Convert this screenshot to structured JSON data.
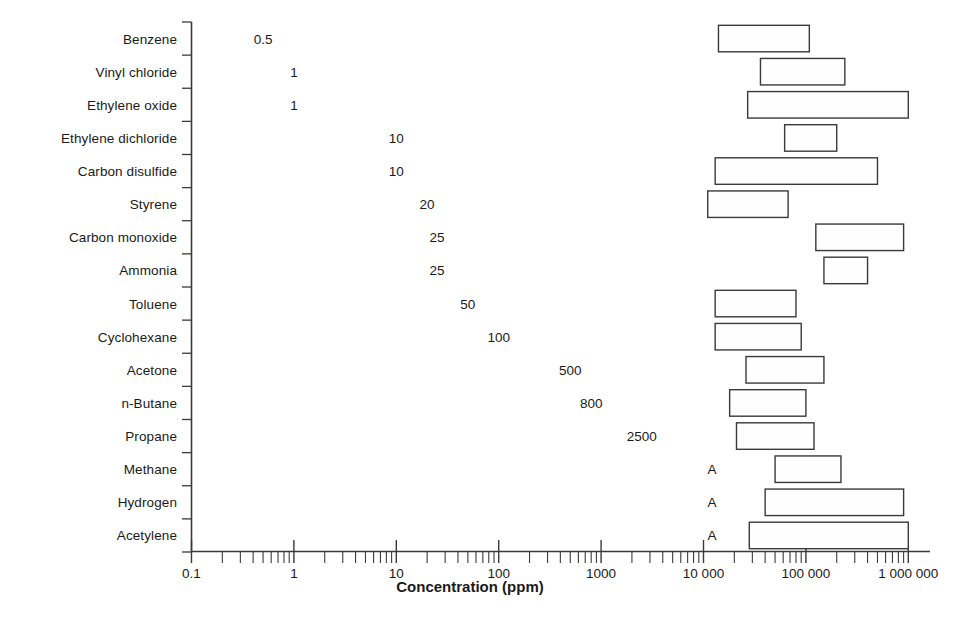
{
  "chart_data": {
    "type": "bar",
    "subtype": "horizontal-range-bar-log",
    "title": "",
    "xlabel": "Concentration (ppm)",
    "ylabel": "",
    "xscale": "log",
    "xlim": [
      0.1,
      1000000
    ],
    "grid": false,
    "legend": null,
    "x_tick_labels": [
      "0.1",
      "1",
      "10",
      "100",
      "1000",
      "10 000",
      "100 000",
      "1 000 000"
    ],
    "x_tick_values": [
      0.1,
      1,
      10,
      100,
      1000,
      10000,
      100000,
      1000000
    ],
    "categories": [
      "Benzene",
      "Vinyl chloride",
      "Ethylene oxide",
      "Ethylene dichloride",
      "Carbon disulfide",
      "Styrene",
      "Carbon monoxide",
      "Ammonia",
      "Toluene",
      "Cyclohexane",
      "Acetone",
      "n-Butane",
      "Propane",
      "Methane",
      "Hydrogen",
      "Acetylene"
    ],
    "oel_labels": [
      "0.5",
      "1",
      "1",
      "10",
      "10",
      "20",
      "25",
      "25",
      "50",
      "100",
      "500",
      "800",
      "2500",
      "A",
      "A",
      "A"
    ],
    "oel_values": [
      0.5,
      1,
      1,
      10,
      10,
      20,
      25,
      25,
      50,
      100,
      500,
      800,
      2500,
      null,
      null,
      null
    ],
    "oel_label_note": "A = asphyxiant (no numeric occupational exposure limit plotted)",
    "ranges": [
      {
        "category": "Benzene",
        "low": 14000,
        "high": 108000
      },
      {
        "category": "Vinyl chloride",
        "low": 36000,
        "high": 240000
      },
      {
        "category": "Ethylene oxide",
        "low": 27000,
        "high": 1000000
      },
      {
        "category": "Ethylene dichloride",
        "low": 62000,
        "high": 200000
      },
      {
        "category": "Carbon disulfide",
        "low": 13000,
        "high": 500000
      },
      {
        "category": "Styrene",
        "low": 11000,
        "high": 67000
      },
      {
        "category": "Carbon monoxide",
        "low": 125000,
        "high": 900000
      },
      {
        "category": "Ammonia",
        "low": 150000,
        "high": 400000
      },
      {
        "category": "Toluene",
        "low": 13000,
        "high": 80000
      },
      {
        "category": "Cyclohexane",
        "low": 13000,
        "high": 90000
      },
      {
        "category": "Acetone",
        "low": 26000,
        "high": 150000
      },
      {
        "category": "n-Butane",
        "low": 18000,
        "high": 100000
      },
      {
        "category": "Propane",
        "low": 21000,
        "high": 120000
      },
      {
        "category": "Methane",
        "low": 50000,
        "high": 220000
      },
      {
        "category": "Hydrogen",
        "low": 40000,
        "high": 900000
      },
      {
        "category": "Acetylene",
        "low": 28000,
        "high": 1000000
      }
    ]
  },
  "axis": {
    "x_title": "Concentration (ppm)"
  },
  "colors": {
    "bar_stroke": "#3a3a3a",
    "bar_fill": "#fefefe",
    "axis": "#3a3a3a",
    "text": "#1a1a1a",
    "background": "#ffffff"
  }
}
